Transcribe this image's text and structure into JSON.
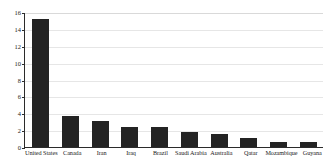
{
  "chart_data": {
    "type": "bar",
    "title": "",
    "xlabel": "",
    "ylabel": "Million bar/d",
    "ylim": [
      0,
      16
    ],
    "yticks": [
      0,
      2,
      4,
      6,
      8,
      10,
      12,
      14,
      16
    ],
    "ytick_labels": [
      "0",
      "2",
      "4",
      "6",
      "8",
      "10",
      "12",
      "14",
      "16"
    ],
    "grid": true,
    "legend": "none",
    "bar_color": "#232323",
    "categories": [
      "United States",
      "Canada",
      "Iran",
      "Iraq",
      "Brazil",
      "Saudi Arabia",
      "Australia",
      "Qatar",
      "Mozambique",
      "Guyana"
    ],
    "values": [
      15.2,
      3.65,
      3.1,
      2.4,
      2.35,
      1.8,
      1.5,
      1.05,
      0.65,
      0.55
    ]
  }
}
